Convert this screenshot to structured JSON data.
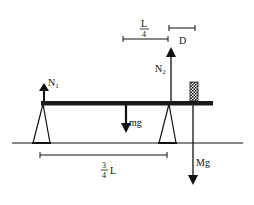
{
  "diagram": {
    "type": "physics-free-body",
    "colors": {
      "ink": "#111111",
      "background": "#ffffff"
    },
    "forces": {
      "n1": {
        "label": "N",
        "subscript": "1",
        "direction": "up"
      },
      "n2": {
        "label": "N",
        "subscript": "2",
        "direction": "up"
      },
      "plank_weight": {
        "label": "mg",
        "direction": "down"
      },
      "block_weight": {
        "label": "Mg",
        "direction": "down"
      }
    },
    "dimensions": {
      "quarter_length": {
        "numerator": "L",
        "denominator": "4"
      },
      "overhang": {
        "label": "D"
      },
      "three_quarter_length": {
        "numerator": "3",
        "denominator": "4",
        "suffix": "L"
      }
    }
  }
}
